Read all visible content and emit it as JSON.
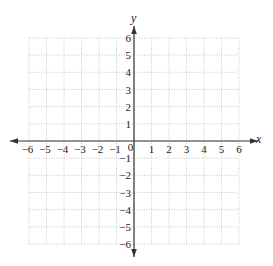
{
  "chart_data": {
    "type": "scatter",
    "title": "",
    "xlabel": "x",
    "ylabel": "y",
    "xlim": [
      -6,
      6
    ],
    "ylim": [
      -6,
      6
    ],
    "grid": true,
    "grid_style": "dotted",
    "x_ticks": [
      "-6",
      "-5",
      "-4",
      "-3",
      "-2",
      "-1",
      "0",
      "1",
      "2",
      "3",
      "4",
      "5",
      "6"
    ],
    "y_ticks": [
      "6",
      "5",
      "4",
      "3",
      "2",
      "1",
      "-1",
      "-2",
      "-3",
      "-4",
      "-5",
      "-6"
    ],
    "series": [],
    "origin_label": "0"
  },
  "colors": {
    "axis": "#333333",
    "grid": "#bbbbbb",
    "text": "#222222"
  }
}
